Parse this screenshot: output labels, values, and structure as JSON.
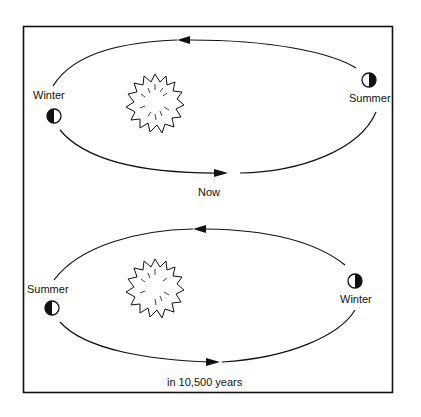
{
  "diagram": {
    "type": "orbit-precession",
    "top_panel": {
      "left_label": "Winter",
      "right_label": "Summer",
      "caption": "Now"
    },
    "bottom_panel": {
      "left_label": "Summer",
      "right_label": "Winter",
      "caption": "in 10,500 years"
    },
    "icons": [
      "sun-icon",
      "earth-phase-icon"
    ]
  }
}
